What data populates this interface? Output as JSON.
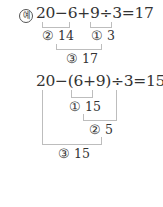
{
  "example_label": "예",
  "example1": {
    "expression": "20−6+9÷3=17",
    "steps": [
      {
        "marker": "②",
        "value": "14"
      },
      {
        "marker": "①",
        "value": "3"
      },
      {
        "marker": "③",
        "value": "17"
      }
    ]
  },
  "example2": {
    "expression": "20−(6+9)÷3=15",
    "steps": [
      {
        "marker": "①",
        "value": "15"
      },
      {
        "marker": "②",
        "value": "5"
      },
      {
        "marker": "③",
        "value": "15"
      }
    ]
  }
}
